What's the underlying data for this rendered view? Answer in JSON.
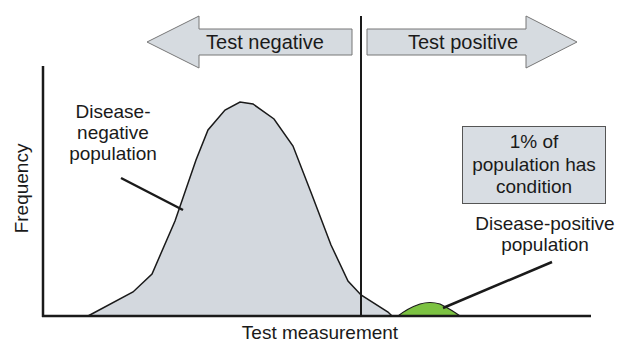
{
  "diagram": {
    "arrows": {
      "left_label": "Test negative",
      "right_label": "Test positive"
    },
    "labels": {
      "negative_population": [
        "Disease-",
        "negative",
        "population"
      ],
      "positive_population": [
        "Disease-positive",
        "population"
      ],
      "note": [
        "1% of",
        "population has",
        "condition"
      ]
    },
    "axes": {
      "x_label": "Test measurement",
      "y_label": "Frequency"
    },
    "colors": {
      "negative_fill": "#d3d8de",
      "positive_fill": "#7cc242",
      "arrow_fill": "#d6dbe0",
      "stroke": "#1a1a1a"
    }
  }
}
